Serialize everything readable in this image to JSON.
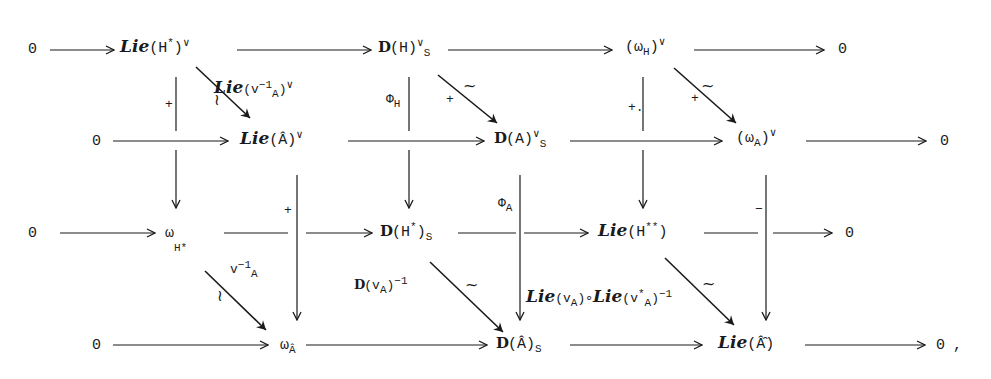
{
  "diagram": {
    "type": "commutative-diagram",
    "trailing_punctuation": ",",
    "rows": [
      {
        "id": "row1",
        "nodes": [
          {
            "id": "r1_0l",
            "text": "0"
          },
          {
            "id": "r1_lieHstar",
            "script": "Lie",
            "body": "(H",
            "sup": "*",
            "close": ")",
            "post_sup": "∨"
          },
          {
            "id": "r1_DH",
            "bb": "D",
            "body": "(H)",
            "post_sup": "∨",
            "sub": "S"
          },
          {
            "id": "r1_omegaH",
            "body": "(ω",
            "sub": "H",
            "close": ")",
            "post_sup": "∨"
          },
          {
            "id": "r1_0r",
            "text": "0"
          }
        ]
      },
      {
        "id": "row2",
        "nodes": [
          {
            "id": "r2_0l",
            "text": "0"
          },
          {
            "id": "r2_lieAhat",
            "script": "Lie",
            "body": "(Â)",
            "post_sup": "∨"
          },
          {
            "id": "r2_DA",
            "bb": "D",
            "body": "(A)",
            "post_sup": "∨",
            "sub": "S"
          },
          {
            "id": "r2_omegaA",
            "body": "(ω",
            "sub": "A",
            "close": ")",
            "post_sup": "∨"
          },
          {
            "id": "r2_0r",
            "text": "0"
          }
        ]
      },
      {
        "id": "row3",
        "nodes": [
          {
            "id": "r3_0l",
            "text": "0"
          },
          {
            "id": "r3_omegaHstar",
            "body": "ω",
            "sub": "H*"
          },
          {
            "id": "r3_DHstar",
            "bb": "D",
            "body": "(H",
            "sup": "*",
            "close": ")",
            "sub": "S"
          },
          {
            "id": "r3_lieHss",
            "script": "Lie",
            "body": "(H",
            "sup": "**",
            "close": ")"
          },
          {
            "id": "r3_0r",
            "text": "0"
          }
        ]
      },
      {
        "id": "row4",
        "nodes": [
          {
            "id": "r4_0l",
            "text": "0"
          },
          {
            "id": "r4_omegaAhat",
            "body": "ω",
            "sub": "Â"
          },
          {
            "id": "r4_DAhat",
            "bb": "D",
            "body": "(Â)",
            "sub": "S"
          },
          {
            "id": "r4_lieAhathat",
            "script": "Lie",
            "body": "(Â̂)"
          },
          {
            "id": "r4_0r",
            "text": "0"
          }
        ]
      }
    ],
    "arrow_labels": {
      "diag_lie_vA": {
        "script": "Lie",
        "body": "(v",
        "sub": "A",
        "sup": "−1",
        "close": ")",
        "post_sup": "∨",
        "iso": "~"
      },
      "diag_DH_DA": {
        "mark": "+",
        "iso": "~"
      },
      "diag_omegaH_omegaA": {
        "mark": "+",
        "iso": "~"
      },
      "vert_lieHstar": {
        "mark": "+"
      },
      "vert_DH": {
        "phi": "Φ",
        "sub": "H"
      },
      "vert_omegaH": {
        "mark": "+."
      },
      "vert_lieAhat": {
        "mark": "+"
      },
      "vert_DA": {
        "phi": "Φ",
        "sub": "A"
      },
      "vert_omegaA": {
        "mark": "−"
      },
      "diag_vA_inv": {
        "body": "v",
        "sub": "A",
        "sup": "−1",
        "iso": "~"
      },
      "diag_DvA_inv": {
        "bb": "D",
        "body": "(v",
        "sub": "A",
        "close": ")",
        "sup": "−1",
        "iso": "~"
      },
      "vert_composite": {
        "script1": "Lie",
        "body1": "(v",
        "sub1": "A",
        "close1": ")∘",
        "script2": "Lie",
        "body2": "(v",
        "sup2": "*",
        "sub2": "A",
        "close2": ")",
        "sup_end": "−1",
        "iso": "~"
      }
    }
  }
}
